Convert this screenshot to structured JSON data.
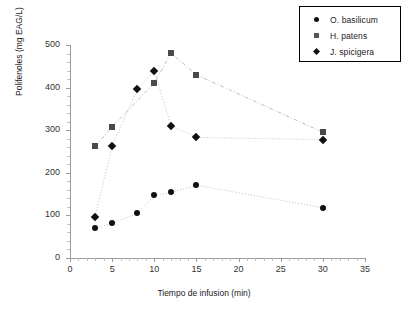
{
  "chart_data": {
    "type": "scatter",
    "title": "",
    "xlabel": "Tiempo de infusion (min)",
    "ylabel": "Polifenoles (mg EAG/L)",
    "xlim": [
      0,
      35
    ],
    "ylim": [
      0,
      500
    ],
    "xticks": [
      0,
      5,
      10,
      15,
      20,
      25,
      30,
      35
    ],
    "yticks": [
      0,
      100,
      200,
      300,
      400,
      500
    ],
    "grid": false,
    "legend_position": "top-right",
    "x": [
      3,
      5,
      8,
      10,
      12,
      15,
      30
    ],
    "series": [
      {
        "name": "O. basilicum",
        "marker": "circle",
        "color": "#111111",
        "x": [
          3,
          5,
          8,
          10,
          12,
          15,
          30
        ],
        "values": [
          70,
          81,
          105,
          147,
          154,
          171,
          118
        ]
      },
      {
        "name": "H. patens",
        "marker": "square",
        "color": "#4a4a4a",
        "x": [
          3,
          5,
          10,
          12,
          15,
          30
        ],
        "values": [
          263,
          308,
          411,
          481,
          430,
          295
        ]
      },
      {
        "name": "J. spicigera",
        "marker": "diamond",
        "color": "#111111",
        "x": [
          3,
          5,
          8,
          10,
          12,
          15,
          30
        ],
        "values": [
          97,
          263,
          397,
          439,
          310,
          283,
          278
        ]
      }
    ]
  },
  "legend": {
    "items": [
      {
        "label": "O. basilicum",
        "marker": "circle"
      },
      {
        "label": "H. patens",
        "marker": "square"
      },
      {
        "label": "J. spicigera",
        "marker": "diamond"
      }
    ]
  },
  "axes": {
    "x_title": "Tiempo de infusion (min)",
    "y_title": "Polifenoles (mg EAG/L)",
    "x_tick_labels": [
      "0",
      "5",
      "10",
      "15",
      "20",
      "25",
      "30",
      "35"
    ],
    "y_tick_labels": [
      "0",
      "100",
      "200",
      "300",
      "400",
      "500"
    ]
  },
  "caption": ""
}
